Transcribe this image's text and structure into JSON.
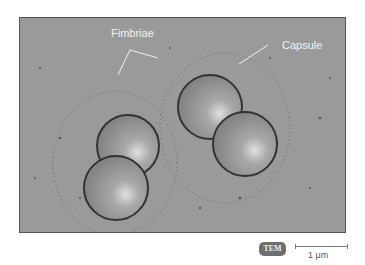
{
  "figure": {
    "labels": {
      "fimbriae": "Fimbriae",
      "capsule": "Capsule"
    },
    "badge": "TEM",
    "scale_bar": {
      "label": "1 μm"
    },
    "colors": {
      "background": "#9a9a9a",
      "cell": "#8e8e8e",
      "highlight": "#d8d8d8",
      "fimbriae": "#2a2a2a",
      "label_text": "#f2f2f2",
      "badge_bg": "#6e6e6e"
    }
  }
}
